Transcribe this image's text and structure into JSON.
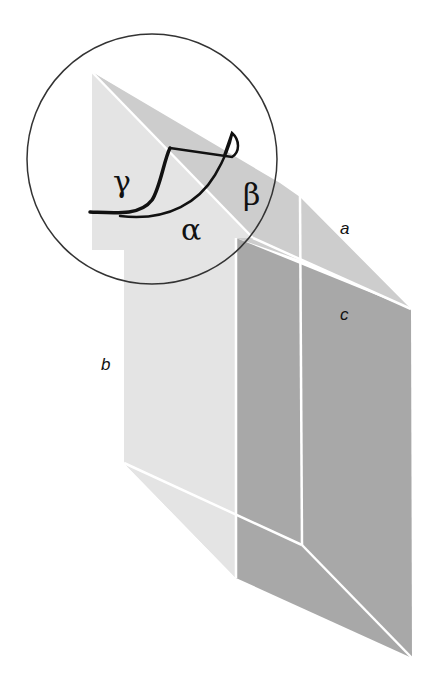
{
  "figure": {
    "type": "crystal-prism-diagram",
    "edge_labels": {
      "a": "a",
      "b": "b",
      "c": "c"
    },
    "angle_labels": {
      "alpha": "α",
      "beta": "β",
      "gamma": "γ"
    },
    "colors": {
      "background": "#ffffff",
      "light_face": "#e4e4e4",
      "top_face": "#cdcdcd",
      "dark_face": "#a8a8a8",
      "edge_lines": "#ffffff",
      "circle_stroke": "#333333",
      "angle_curves": "#111111"
    }
  }
}
